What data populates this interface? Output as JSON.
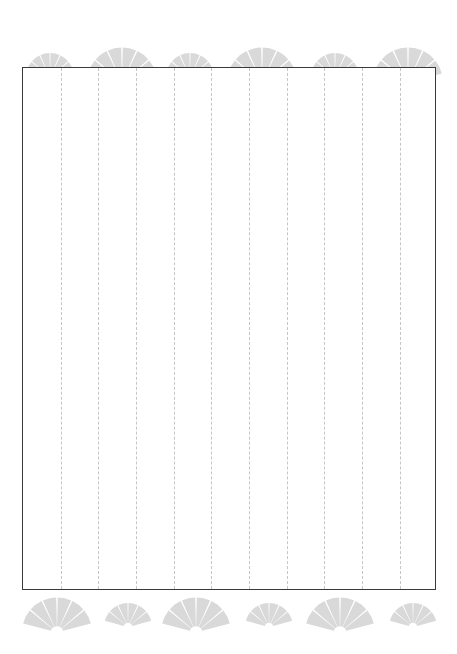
{
  "page": {
    "width": 457,
    "height": 654,
    "background_color": "#ffffff"
  },
  "writing_area": {
    "name": "ruled-writing-area",
    "x": 22,
    "y": 67,
    "width": 414,
    "height": 523,
    "border_color": "#3a3a3a",
    "border_width": 1,
    "fill_color": "#ffffff",
    "rule_line_color": "#c5c5c5",
    "rule_line_style": "dashed",
    "rule_line_count": 10,
    "rule_line_spacing": 37.8,
    "rule_line_positions": [
      37.5,
      75.1,
      112.8,
      150.5,
      188.2,
      225.9,
      263.5,
      301.2,
      338.9,
      376.6
    ]
  },
  "ornaments": {
    "motif_name": "fan-shell-motif",
    "fill_color": "#d9d9d9",
    "gap_color": "#ffffff",
    "segments": 6,
    "top_row": {
      "name": "ornament-row-top",
      "center_y": 45,
      "fans": [
        {
          "name": "fan-top-1",
          "cx": 50,
          "size": "small",
          "radius": 24
        },
        {
          "name": "fan-top-2",
          "cx": 122,
          "size": "large",
          "radius": 35
        },
        {
          "name": "fan-top-3",
          "cx": 190,
          "size": "small",
          "radius": 24
        },
        {
          "name": "fan-top-4",
          "cx": 262,
          "size": "large",
          "radius": 35
        },
        {
          "name": "fan-top-5",
          "cx": 335,
          "size": "small",
          "radius": 24
        },
        {
          "name": "fan-top-6",
          "cx": 408,
          "size": "large",
          "radius": 35
        }
      ]
    },
    "bottom_row": {
      "name": "ornament-row-bottom",
      "center_y": 23,
      "fans": [
        {
          "name": "fan-bottom-1",
          "cx": 57,
          "size": "large",
          "radius": 35
        },
        {
          "name": "fan-bottom-2",
          "cx": 128,
          "size": "small",
          "radius": 24
        },
        {
          "name": "fan-bottom-3",
          "cx": 196,
          "size": "large",
          "radius": 35
        },
        {
          "name": "fan-bottom-4",
          "cx": 269,
          "size": "small",
          "radius": 24
        },
        {
          "name": "fan-bottom-5",
          "cx": 340,
          "size": "large",
          "radius": 35
        },
        {
          "name": "fan-bottom-6",
          "cx": 413,
          "size": "small",
          "radius": 24
        }
      ]
    }
  }
}
